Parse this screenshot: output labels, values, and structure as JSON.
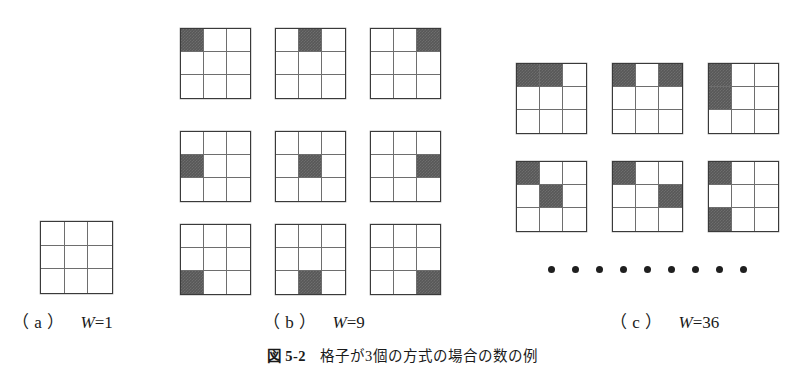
{
  "figure": {
    "caption_label": "図 5-2",
    "caption_text": "格子が3個の方式の場合の数の例",
    "filled_color": "#585858",
    "line_color": "#3a3a3a",
    "inner_line_color": "#6e6e6e"
  },
  "panels": [
    {
      "id": "a",
      "tag": "（ a ）",
      "formula_var": "W",
      "formula_eq": "=",
      "formula_value": "1",
      "grid_count": 1,
      "grids": [
        {
          "name": "grid-a-1",
          "cells": [
            0,
            0,
            0,
            0,
            0,
            0,
            0,
            0,
            0
          ]
        }
      ]
    },
    {
      "id": "b",
      "tag": "（ b ）",
      "formula_var": "W",
      "formula_eq": "=",
      "formula_value": "9",
      "grid_count": 9,
      "grids": [
        {
          "name": "grid-b-1",
          "cells": [
            1,
            0,
            0,
            0,
            0,
            0,
            0,
            0,
            0
          ]
        },
        {
          "name": "grid-b-2",
          "cells": [
            0,
            1,
            0,
            0,
            0,
            0,
            0,
            0,
            0
          ]
        },
        {
          "name": "grid-b-3",
          "cells": [
            0,
            0,
            1,
            0,
            0,
            0,
            0,
            0,
            0
          ]
        },
        {
          "name": "grid-b-4",
          "cells": [
            0,
            0,
            0,
            1,
            0,
            0,
            0,
            0,
            0
          ]
        },
        {
          "name": "grid-b-5",
          "cells": [
            0,
            0,
            0,
            0,
            1,
            0,
            0,
            0,
            0
          ]
        },
        {
          "name": "grid-b-6",
          "cells": [
            0,
            0,
            0,
            0,
            0,
            1,
            0,
            0,
            0
          ]
        },
        {
          "name": "grid-b-7",
          "cells": [
            0,
            0,
            0,
            0,
            0,
            0,
            1,
            0,
            0
          ]
        },
        {
          "name": "grid-b-8",
          "cells": [
            0,
            0,
            0,
            0,
            0,
            0,
            0,
            1,
            0
          ]
        },
        {
          "name": "grid-b-9",
          "cells": [
            0,
            0,
            0,
            0,
            0,
            0,
            0,
            0,
            1
          ]
        }
      ]
    },
    {
      "id": "c",
      "tag": "（ c ）",
      "formula_var": "W",
      "formula_eq": "=",
      "formula_value": "36",
      "grid_count": 6,
      "ellipsis_dots": 9,
      "grids": [
        {
          "name": "grid-c-1",
          "cells": [
            1,
            1,
            0,
            0,
            0,
            0,
            0,
            0,
            0
          ]
        },
        {
          "name": "grid-c-2",
          "cells": [
            1,
            0,
            1,
            0,
            0,
            0,
            0,
            0,
            0
          ]
        },
        {
          "name": "grid-c-3",
          "cells": [
            1,
            0,
            0,
            1,
            0,
            0,
            0,
            0,
            0
          ]
        },
        {
          "name": "grid-c-4",
          "cells": [
            1,
            0,
            0,
            0,
            1,
            0,
            0,
            0,
            0
          ]
        },
        {
          "name": "grid-c-5",
          "cells": [
            1,
            0,
            0,
            0,
            0,
            1,
            0,
            0,
            0
          ]
        },
        {
          "name": "grid-c-6",
          "cells": [
            1,
            0,
            0,
            0,
            0,
            0,
            1,
            0,
            0
          ]
        }
      ]
    }
  ]
}
